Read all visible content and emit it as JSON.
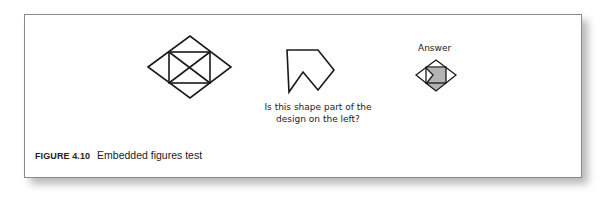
{
  "figure": {
    "number_label": "FIGURE 4.10",
    "title": "Embedded figures test"
  },
  "question": {
    "line1": "Is this shape part of the",
    "line2": "design on the left?"
  },
  "answer": {
    "label": "Answer",
    "shade_color": "#b3b3b3"
  },
  "colors": {
    "stroke": "#1a1a1a",
    "frame_border": "#8a8a8a"
  }
}
